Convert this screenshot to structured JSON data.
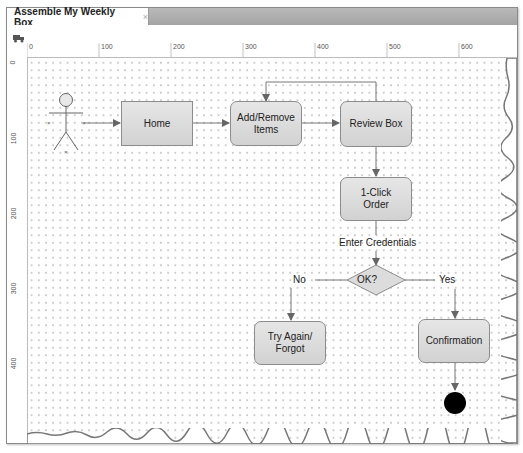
{
  "tab": {
    "title": "Assemble My Weekly Box",
    "close": "×"
  },
  "toolbar": {
    "icon": "truck-icon"
  },
  "rulers": {
    "horizontal": [
      "0",
      "100",
      "200",
      "300",
      "400",
      "500",
      "600"
    ],
    "vertical": [
      "0",
      "100",
      "200",
      "300",
      "400"
    ]
  },
  "diagram": {
    "actor": "actor-stick-figure",
    "nodes": {
      "home": "Home",
      "add_remove": "Add/Remove Items",
      "add_remove_l1": "Add/Remove",
      "add_remove_l2": "Items",
      "review": "Review Box",
      "one_click_l1": "1-Click",
      "one_click_l2": "Order",
      "decision": "OK?",
      "try_again_l1": "Try Again/",
      "try_again_l2": "Forgot",
      "confirmation": "Confirmation"
    },
    "edge_labels": {
      "enter_credentials": "Enter Credentials",
      "no": "No",
      "yes": "Yes"
    },
    "end_node": "final-state"
  },
  "colors": {
    "node_fill": "#dcdcdc",
    "node_border": "#8c8c8c",
    "tabbar": "#b0b0b0",
    "end": "#000000"
  }
}
